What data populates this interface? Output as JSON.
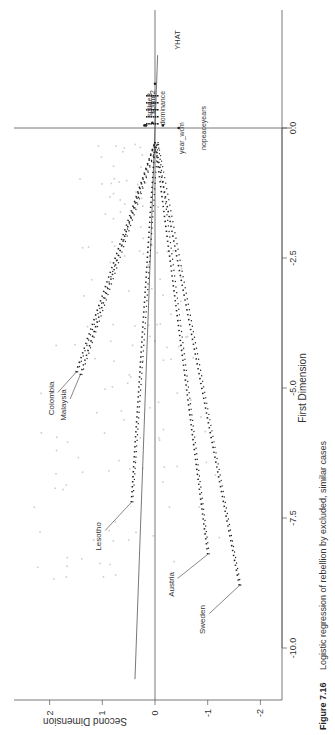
{
  "figure": {
    "number_label": "Figure 7.16",
    "caption": "Logistic regression of rebellion by excluded, similar cases",
    "rotation": "page rotated 90 degrees counterclockwise"
  },
  "colors": {
    "axis": "#555555",
    "text": "#333333",
    "points_dark": "#222222",
    "points_light": "#cccccc"
  },
  "chart_data": {
    "type": "scatter",
    "title": "",
    "xlabel": "First Dimension",
    "ylabel": "Second Dimension",
    "xlim": [
      -10.6,
      1.4
    ],
    "ylim": [
      -2.4,
      2.8
    ],
    "x_ticks": [
      "-10.0",
      "-7.5",
      "-5.0",
      "-2.5",
      "0.0"
    ],
    "x_tick_values": [
      -10.0,
      -7.5,
      -5.0,
      -2.5,
      0.0
    ],
    "y_ticks": [
      "-2",
      "-1",
      "0",
      "1",
      "2"
    ],
    "y_tick_values": [
      -2,
      -1,
      0,
      1,
      2
    ],
    "reference_lines": [
      {
        "type": "vertical",
        "x": 0.0
      },
      {
        "type": "horizontal",
        "y": 0.0
      },
      {
        "type": "regression-line",
        "from": [
          -10.6,
          0.38
        ],
        "to": [
          1.4,
          -0.05
        ]
      }
    ],
    "labeled_cases": [
      {
        "label": "Colombia",
        "x": -4.7,
        "y": 1.5
      },
      {
        "label": "Malaysia",
        "x": -4.75,
        "y": 1.42
      },
      {
        "label": "Lesotho",
        "x": -7.2,
        "y": 0.45
      },
      {
        "label": "Austria",
        "x": -8.2,
        "y": -1.0
      },
      {
        "label": "Sweden",
        "x": -8.8,
        "y": -1.6
      }
    ],
    "variable_labels": [
      {
        "label": "YHAT",
        "x": 0.85,
        "y": 0.0
      },
      {
        "label": "spline3",
        "x": 0.05,
        "y": 0.2
      },
      {
        "label": "spline2",
        "x": 0.05,
        "y": 0.17
      },
      {
        "label": "dominance",
        "x": 0.1,
        "y": 0.05
      },
      {
        "label": "year_wcm",
        "x": 0.05,
        "y": -0.15
      },
      {
        "label": "nopeaceyears",
        "x": 0.0,
        "y": -0.45
      }
    ],
    "connector_lines": "dotted lines from each labeled case to origin cluster",
    "background_points": "approx. 150 light grey observations between First Dimension -9 and 0"
  }
}
